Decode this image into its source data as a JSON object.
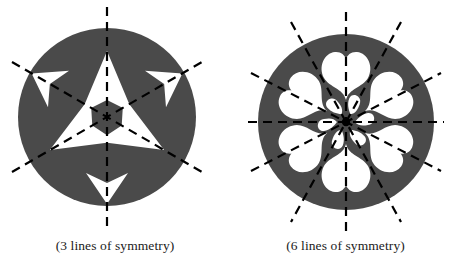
{
  "page": {
    "background_color": "#ffffff",
    "figure_fill_color": "#4a4a4a",
    "shape_fill_color": "#ffffff",
    "symmetry_line_color": "#000000"
  },
  "figures": [
    {
      "id": "three-fold-rosette",
      "caption": "(3 lines of symmetry)",
      "symmetry_lines": 3,
      "rotational_order": 3,
      "circle": {
        "cx": 107,
        "cy": 117,
        "r": 89
      },
      "line_angles_deg": [
        90,
        30,
        150
      ],
      "inner_shape": "arrow-chevron",
      "outer_shape": "dart-arrowhead",
      "inner_shape_count": 3,
      "outer_shape_count": 3
    },
    {
      "id": "six-fold-rosette",
      "caption": "(6 lines of symmetry)",
      "symmetry_lines": 6,
      "rotational_order": 6,
      "circle": {
        "cx": 116,
        "cy": 122,
        "r": 88
      },
      "line_angles_deg": [
        0,
        30,
        60,
        90,
        120,
        150
      ],
      "inner_shape": "small-wedge",
      "outer_shape": "heart-petal",
      "inner_shape_count": 6,
      "outer_shape_count": 6,
      "center_dot": true
    }
  ]
}
